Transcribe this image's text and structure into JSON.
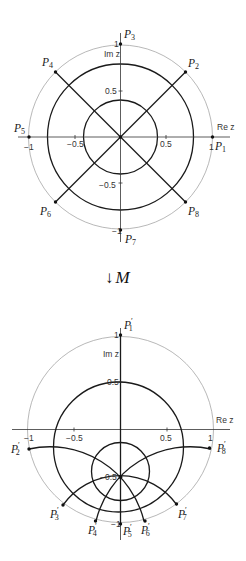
{
  "top_plot": {
    "axis_labels": {
      "re": "Re z",
      "im": "Im z"
    },
    "tick_labels": {
      "x_neg1": "−1",
      "x_neg05": "−0.5",
      "x_05": "0.5",
      "x_1": "1",
      "y_1": "1",
      "y_05": "0.5",
      "y_neg05": "−0.5",
      "y_neg1": "−1"
    },
    "points": [
      {
        "name": "P",
        "sub": "1"
      },
      {
        "name": "P",
        "sub": "2"
      },
      {
        "name": "P",
        "sub": "3"
      },
      {
        "name": "P",
        "sub": "4"
      },
      {
        "name": "P",
        "sub": "5"
      },
      {
        "name": "P",
        "sub": "6"
      },
      {
        "name": "P",
        "sub": "7"
      },
      {
        "name": "P",
        "sub": "8"
      }
    ]
  },
  "mapping": {
    "arrow": "↓",
    "label": "M"
  },
  "bottom_plot": {
    "axis_labels": {
      "re": "Re z",
      "im": "Im z"
    },
    "tick_labels": {
      "x_neg1": "−1",
      "x_neg05": "−0.5",
      "x_05": "0.5",
      "x_1": "1",
      "y_1": "1",
      "y_05": "0.5",
      "y_neg05": "−0.5",
      "y_neg1": "−1"
    },
    "prime": "′",
    "points": [
      {
        "name": "P",
        "sub": "1"
      },
      {
        "name": "P",
        "sub": "2"
      },
      {
        "name": "P",
        "sub": "3"
      },
      {
        "name": "P",
        "sub": "4"
      },
      {
        "name": "P",
        "sub": "5"
      },
      {
        "name": "P",
        "sub": "6"
      },
      {
        "name": "P",
        "sub": "7"
      },
      {
        "name": "P",
        "sub": "8"
      }
    ]
  }
}
